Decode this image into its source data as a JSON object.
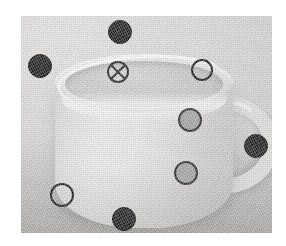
{
  "scene": {
    "title": "Coffee cup photograph with annotated probe points",
    "subject": "white ceramic coffee cup with handle on right",
    "image_type": "grayscale-photograph",
    "plate": {
      "x": 21,
      "y": 16,
      "width": 251,
      "height": 217
    },
    "background_color": "#d6d6d4",
    "cup_color": "#efeeec"
  },
  "legend": {
    "black_filled": "#242424",
    "gray_filled": "#a8a8a6",
    "open_outline": "#1f1f1f",
    "crossed_circle": "#2a2a2a"
  },
  "markers": [
    {
      "id": "m1",
      "name": "marker-top-rim-black",
      "type": "filled-dark",
      "x": 120,
      "y": 32,
      "r": 12
    },
    {
      "id": "m2",
      "name": "marker-left-rim-black",
      "type": "filled-dark",
      "x": 40,
      "y": 66,
      "r": 12
    },
    {
      "id": "m3",
      "name": "marker-interior-crossed",
      "type": "crossed",
      "x": 118,
      "y": 72,
      "r": 11
    },
    {
      "id": "m4",
      "name": "marker-right-rim-open",
      "type": "open",
      "x": 202,
      "y": 70,
      "r": 11
    },
    {
      "id": "m5",
      "name": "marker-upper-body-gray",
      "type": "filled-gray",
      "x": 190,
      "y": 120,
      "r": 12
    },
    {
      "id": "m6",
      "name": "marker-handle-right-black",
      "type": "filled-dark",
      "x": 256,
      "y": 146,
      "r": 12
    },
    {
      "id": "m7",
      "name": "marker-lower-body-gray",
      "type": "filled-gray",
      "x": 186,
      "y": 173,
      "r": 12
    },
    {
      "id": "m8",
      "name": "marker-lower-left-open",
      "type": "open",
      "x": 62,
      "y": 195,
      "r": 12
    },
    {
      "id": "m9",
      "name": "marker-bottom-body-black",
      "type": "filled-dark",
      "x": 124,
      "y": 219,
      "r": 12
    }
  ]
}
